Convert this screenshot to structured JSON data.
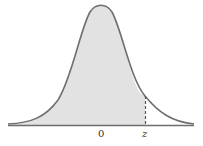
{
  "diagram": {
    "labels": {
      "mean": "0",
      "z": "z"
    },
    "colors": {
      "curve": "#6e6e6e",
      "shade": "#e2e2e2",
      "axis": "#6e6e6e",
      "dashed": "#555555"
    }
  }
}
